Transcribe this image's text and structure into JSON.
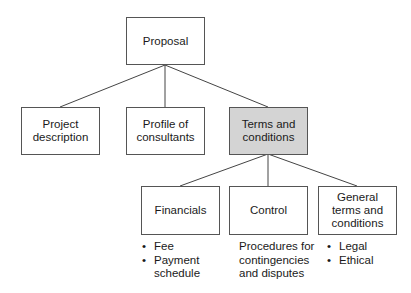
{
  "diagram": {
    "root": {
      "label": "Proposal"
    },
    "level1": [
      {
        "label": "Project\ndescription"
      },
      {
        "label": "Profile of\nconsultants"
      },
      {
        "label": "Terms and\nconditions",
        "highlighted": true
      }
    ],
    "level2": [
      {
        "label": "Financials",
        "notes": [
          "Fee",
          "Payment\nschedule"
        ]
      },
      {
        "label": "Control",
        "notes_text": "Procedures for\ncontingencies\nand disputes"
      },
      {
        "label": "General\nterms and\nconditions",
        "notes": [
          "Legal",
          "Ethical"
        ]
      }
    ],
    "colors": {
      "border": "#555555",
      "highlight_fill": "#d4d4d4",
      "line": "#444444"
    }
  }
}
